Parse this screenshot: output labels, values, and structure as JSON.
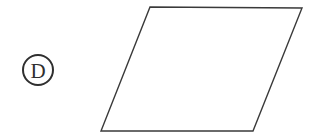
{
  "figure": {
    "background_color": "#ffffff",
    "stroke_color": "#3a3a3a",
    "canvas": {
      "width": 314,
      "height": 138
    },
    "choice_label": {
      "letter": "D",
      "style": "circled",
      "circle_center_x": 38,
      "circle_center_y": 70,
      "circle_radius": 15,
      "circle_stroke_width": 2,
      "text_color": "#2f2f2f"
    },
    "shape": {
      "name": "parallelogram",
      "fill": "none",
      "stroke_width": 1.4,
      "points": "150,7 302,8 253,131 101,131",
      "vertices": [
        {
          "name": "top-left",
          "x": 150,
          "y": 7
        },
        {
          "name": "top-right",
          "x": 302,
          "y": 8
        },
        {
          "name": "bottom-right",
          "x": 253,
          "y": 131
        },
        {
          "name": "bottom-left",
          "x": 101,
          "y": 131
        }
      ]
    }
  }
}
